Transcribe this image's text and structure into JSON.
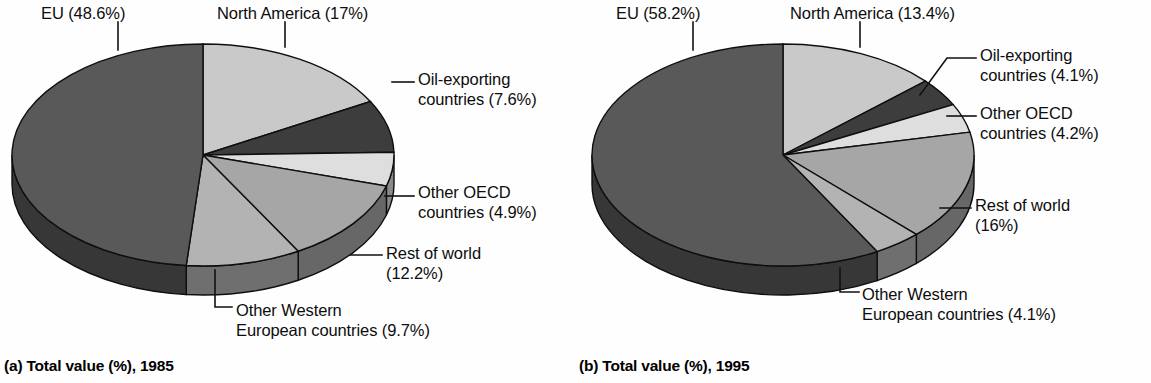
{
  "figure": {
    "title": "",
    "panels": [
      "a",
      "b"
    ]
  },
  "chart_data": [
    {
      "type": "pie",
      "panel": "a",
      "title": "(a) Total value (%), 1985",
      "year": "1985",
      "categories": [
        "North America",
        "Oil-exporting countries",
        "Other OECD countries",
        "Rest of world",
        "Other Western European countries",
        "EU"
      ],
      "values": [
        17,
        7.6,
        4.9,
        12.2,
        9.7,
        48.6
      ],
      "labels": [
        "North America (17%)",
        "Oil-exporting\ncountries (7.6%)",
        "Other OECD\ncountries (4.9%)",
        "Rest of world\n(12.2%)",
        "Other Western\nEuropean countries (9.7%)",
        "EU (48.6%)"
      ],
      "colors": [
        "#c9c9c9",
        "#3d3d3d",
        "#dedede",
        "#a6a6a6",
        "#b3b3b3",
        "#595959"
      ],
      "legend": "callout-labels",
      "grid": false
    },
    {
      "type": "pie",
      "panel": "b",
      "title": "(b) Total value (%), 1995",
      "year": "1995",
      "categories": [
        "North America",
        "Oil-exporting countries",
        "Other OECD countries",
        "Rest of world",
        "Other Western European countries",
        "EU"
      ],
      "values": [
        13.4,
        4.1,
        4.2,
        16,
        4.1,
        58.2
      ],
      "labels": [
        "North America (13.4%)",
        "Oil-exporting\ncountries (4.1%)",
        "Other OECD\ncountries (4.2%)",
        "Rest of world\n(16%)",
        "Other Western\nEuropean countries (4.1%)",
        "EU (58.2%)"
      ],
      "colors": [
        "#c9c9c9",
        "#3d3d3d",
        "#dedede",
        "#a6a6a6",
        "#b3b3b3",
        "#595959"
      ],
      "legend": "callout-labels",
      "grid": false
    }
  ],
  "panel_a": {
    "caption": "(a) Total value (%), 1985",
    "label_eu": "EU (48.6%)",
    "label_na": "North America (17%)",
    "label_oil_l1": "Oil-exporting",
    "label_oil_l2": "countries (7.6%)",
    "label_oecd_l1": "Other OECD",
    "label_oecd_l2": "countries (4.9%)",
    "label_row_l1": "Rest of world",
    "label_row_l2": "(12.2%)",
    "label_owe_l1": "Other Western",
    "label_owe_l2": "European countries (9.7%)"
  },
  "panel_b": {
    "caption": "(b) Total value (%), 1995",
    "label_eu": "EU (58.2%)",
    "label_na": "North America (13.4%)",
    "label_oil_l1": "Oil-exporting",
    "label_oil_l2": "countries (4.1%)",
    "label_oecd_l1": "Other OECD",
    "label_oecd_l2": "countries (4.2%)",
    "label_row_l1": "Rest of world",
    "label_row_l2": "(16%)",
    "label_owe_l1": "Other Western",
    "label_owe_l2": "European countries (4.1%)"
  }
}
